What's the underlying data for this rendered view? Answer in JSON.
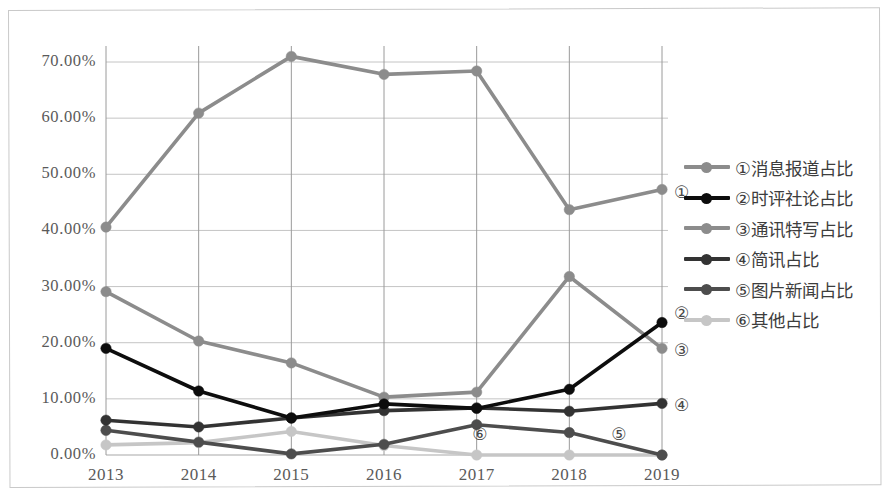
{
  "chart_data": {
    "type": "line",
    "title": "",
    "xlabel": "",
    "ylabel": "",
    "grid": true,
    "legend_position": "right",
    "categories": [
      "2013",
      "2014",
      "2015",
      "2016",
      "2017",
      "2018",
      "2019"
    ],
    "ylim": [
      0,
      70
    ],
    "yticks": [
      "0.00%",
      "10.00%",
      "20.00%",
      "30.00%",
      "40.00%",
      "50.00%",
      "60.00%",
      "70.00%"
    ],
    "ytick_values": [
      0,
      10,
      20,
      30,
      40,
      50,
      60,
      70
    ],
    "series": [
      {
        "name": "①消息报道占比",
        "marker": "①",
        "color": "#8c8c8c",
        "values": [
          40.6,
          60.9,
          71.0,
          67.8,
          68.4,
          43.7,
          47.3
        ]
      },
      {
        "name": "②时评社论占比",
        "marker": "②",
        "color": "#0d0d0d",
        "values": [
          19.0,
          11.4,
          6.6,
          9.1,
          8.3,
          11.7,
          23.6
        ]
      },
      {
        "name": "③通讯特写占比",
        "marker": "③",
        "color": "#8c8c8c",
        "values": [
          29.1,
          20.3,
          16.4,
          10.3,
          11.2,
          31.8,
          19.0
        ]
      },
      {
        "name": "④简讯占比",
        "marker": "④",
        "color": "#333333",
        "values": [
          6.2,
          5.0,
          6.6,
          7.9,
          8.4,
          7.8,
          9.2
        ]
      },
      {
        "name": "⑤图片新闻占比",
        "marker": "⑤",
        "color": "#4d4d4d",
        "values": [
          4.4,
          2.3,
          0.2,
          1.9,
          5.4,
          4.0,
          0.0
        ]
      },
      {
        "name": "⑥其他占比",
        "marker": "⑥",
        "color": "#c6c6c6",
        "values": [
          1.8,
          2.2,
          4.2,
          1.7,
          0.0,
          0.0,
          0.0
        ]
      }
    ],
    "annotations": [
      {
        "label": "①",
        "x": 2019,
        "y": 46.5
      },
      {
        "label": "②",
        "x": 2019,
        "y": 24.9
      },
      {
        "label": "③",
        "x": 2019,
        "y": 18.4
      },
      {
        "label": "④",
        "x": 2019,
        "y": 8.6
      },
      {
        "label": "⑤",
        "x": 2018.55,
        "y": 3.4
      },
      {
        "label": "⑥",
        "x": 2017.05,
        "y": 3.3
      }
    ]
  },
  "legend": {
    "items": [
      {
        "label": "①消息报道占比",
        "color": "#8c8c8c"
      },
      {
        "label": "②时评社论占比",
        "color": "#0d0d0d"
      },
      {
        "label": "③通讯特写占比",
        "color": "#8c8c8c"
      },
      {
        "label": "④简讯占比",
        "color": "#333333"
      },
      {
        "label": "⑤图片新闻占比",
        "color": "#4d4d4d"
      },
      {
        "label": "⑥其他占比",
        "color": "#c6c6c6"
      }
    ]
  }
}
